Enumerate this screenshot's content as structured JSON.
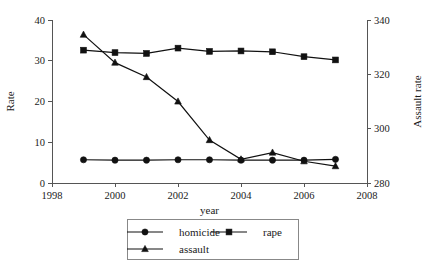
{
  "chart_data": {
    "type": "line",
    "title": "",
    "xlabel": "year",
    "ylabel": "Rate",
    "y2label": "Assault rate",
    "x": [
      1999,
      2000,
      2001,
      2002,
      2003,
      2004,
      2005,
      2006,
      2007
    ],
    "xlim": [
      1998,
      2008
    ],
    "ylim": [
      0,
      40
    ],
    "y2lim": [
      280,
      340
    ],
    "xticks": [
      "1998",
      "2000",
      "2002",
      "2004",
      "2006",
      "2008"
    ],
    "xtick_values": [
      1998,
      2000,
      2002,
      2004,
      2006,
      2008
    ],
    "yticks": [
      "0",
      "10",
      "20",
      "30",
      "40"
    ],
    "ytick_values": [
      0,
      10,
      20,
      30,
      40
    ],
    "y2ticks": [
      "280",
      "300",
      "320",
      "340"
    ],
    "y2tick_values": [
      280,
      300,
      320,
      340
    ],
    "grid": false,
    "legend_position": "bottom",
    "series": [
      {
        "name": "homicide",
        "marker": "circle",
        "axis": "left",
        "values": [
          5.7,
          5.6,
          5.6,
          5.7,
          5.7,
          5.6,
          5.6,
          5.6,
          5.8
        ]
      },
      {
        "name": "rape",
        "marker": "square",
        "axis": "left",
        "values": [
          32.6,
          32.0,
          31.8,
          33.1,
          32.3,
          32.4,
          32.2,
          31.0,
          30.2
        ]
      },
      {
        "name": "assault",
        "marker": "triangle",
        "axis": "right",
        "values_left_scale": [
          36.4,
          29.5,
          26.0,
          20.0,
          10.5,
          5.8,
          7.5,
          5.3,
          4.1
        ],
        "values": [
          334.6,
          324.3,
          319.0,
          310.0,
          295.8,
          288.7,
          291.2,
          288.0,
          286.2
        ]
      }
    ],
    "legend": [
      {
        "label": "homicide",
        "marker": "circle"
      },
      {
        "label": "rape",
        "marker": "square"
      },
      {
        "label": "assault",
        "marker": "triangle"
      }
    ]
  }
}
